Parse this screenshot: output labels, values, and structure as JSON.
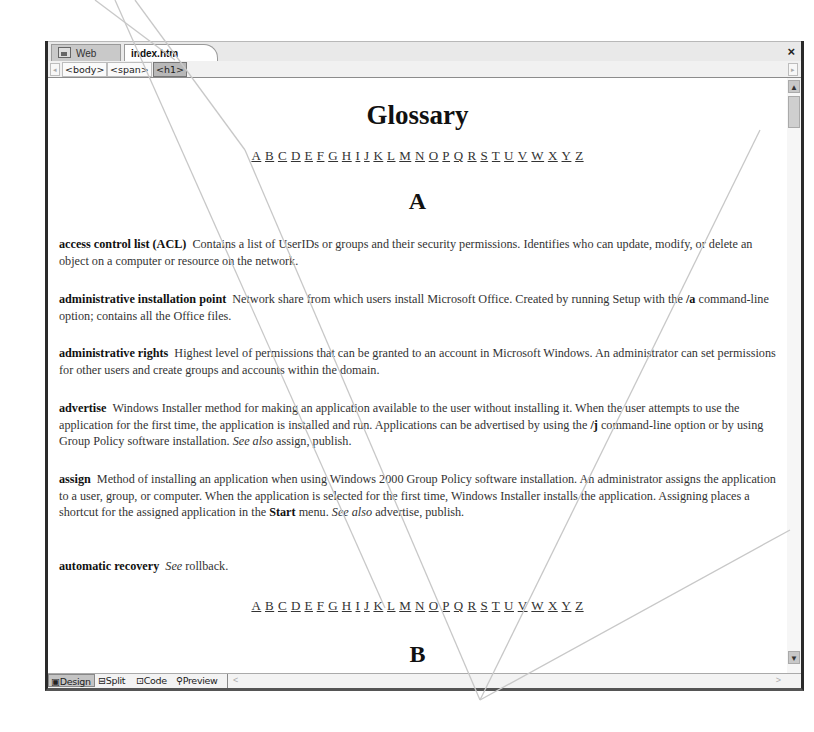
{
  "tabs": [
    {
      "label": "Web Site",
      "icon": "website-icon",
      "active": false
    },
    {
      "label": "index.htm",
      "active": true
    }
  ],
  "close_label": "×",
  "breadcrumb": {
    "scroll_left": "◂",
    "scroll_right": "▸",
    "tags": [
      "<body>",
      "<span>",
      "<h1>"
    ],
    "active_index": 2
  },
  "page": {
    "title": "Glossary",
    "letters": [
      "A",
      "B",
      "C",
      "D",
      "E",
      "F",
      "G",
      "H",
      "I",
      "J",
      "K",
      "L",
      "M",
      "N",
      "O",
      "P",
      "Q",
      "R",
      "S",
      "T",
      "U",
      "V",
      "W",
      "X",
      "Y",
      "Z"
    ],
    "section_a": "A",
    "section_b": "B",
    "entries": [
      {
        "term": "access control list (ACL)",
        "parts": [
          {
            "t": "Contains a list of UserIDs or groups and their security permissions. Identifies who can update, modify, or delete an object on a computer or resource on the network."
          }
        ]
      },
      {
        "term": "administrative installation point",
        "parts": [
          {
            "t": "Network share from which users install Microsoft Office. Created by running Setup with the "
          },
          {
            "t": "/a",
            "b": true
          },
          {
            "t": " command-line option; contains all the Office files."
          }
        ]
      },
      {
        "term": "administrative rights",
        "parts": [
          {
            "t": "Highest level of permissions that can be granted to an account in Microsoft Windows. An administrator can set permissions for other users and create groups and accounts within the domain."
          }
        ]
      },
      {
        "term": "advertise",
        "parts": [
          {
            "t": "Windows Installer method for making an application available to the user without installing it. When the user attempts to use the application for the first time, the application is installed and run. Applications can be advertised by using the "
          },
          {
            "t": "/j",
            "b": true
          },
          {
            "t": " command-line option or by using Group Policy software installation. "
          },
          {
            "t": "See also",
            "i": true
          },
          {
            "t": " assign, publish."
          }
        ]
      },
      {
        "term": "assign",
        "parts": [
          {
            "t": "Method of installing an application when using Windows 2000 Group Policy software installation. An administrator assigns the application to a user, group, or computer. When the application is selected for the first time, Windows Installer installs the application. Assigning places a shortcut for the assigned application in the "
          },
          {
            "t": "Start",
            "b": true
          },
          {
            "t": " menu. "
          },
          {
            "t": "See also",
            "i": true
          },
          {
            "t": " advertise, publish."
          }
        ]
      },
      {
        "term": "automatic recovery",
        "parts": [
          {
            "t": "See",
            "i": true
          },
          {
            "t": " rollback."
          }
        ]
      }
    ]
  },
  "view_modes": [
    {
      "label": "Design",
      "icon": "design-view-icon",
      "active": true
    },
    {
      "label": "Split",
      "icon": "split-view-icon",
      "active": false
    },
    {
      "label": "Code",
      "icon": "code-view-icon",
      "active": false
    },
    {
      "label": "Preview",
      "icon": "preview-view-icon",
      "active": false
    }
  ],
  "scroll": {
    "up": "▲",
    "down": "▼",
    "h_left": "<",
    "h_right": ">"
  },
  "colors": {
    "frame": "#2a2a2a",
    "tabbar": "#e9e9e9",
    "active_crumb": "#b8b8b8",
    "overlay_line": "#c8c8c8"
  }
}
